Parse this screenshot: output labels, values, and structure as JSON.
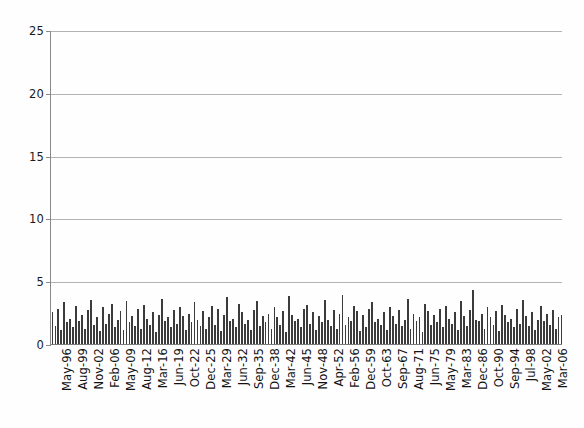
{
  "chart_data": {
    "type": "bar",
    "title": "",
    "subtitle": "",
    "xlabel": "",
    "ylabel": "",
    "ylim": [
      0,
      25
    ],
    "yticks": [
      0,
      5,
      10,
      15,
      20,
      25
    ],
    "grid": true,
    "legend": false,
    "legend_position": "none",
    "series_color": "#3b3b3b",
    "gridline_color": "#b3b3b3",
    "axis_color": "#8a8a8a",
    "bar_count": 173,
    "x_tick_labels": [
      "May-96",
      "Aug-99",
      "Nov-02",
      "Feb-06",
      "May-09",
      "Aug-12",
      "Mar-16",
      "Jun-19",
      "Oct-22",
      "Dec-25",
      "Mar-29",
      "Jun-32",
      "Sep-35",
      "Dec-38",
      "Mar-42",
      "Jun-45",
      "Nov-48",
      "Apr-52",
      "Feb-56",
      "Dec-59",
      "Oct-63",
      "Sep-67",
      "Aug-71",
      "Jun-75",
      "May-79",
      "Mar-83",
      "Dec-86",
      "Oct-90",
      "Sep-94",
      "Jul-98",
      "May-02",
      "Mar-06"
    ],
    "values": [
      2.6,
      1.5,
      2.9,
      1.2,
      3.4,
      1.8,
      2.1,
      1.4,
      3.1,
      1.9,
      2.4,
      1.3,
      2.8,
      3.6,
      1.6,
      2.2,
      1.1,
      3.0,
      1.7,
      2.5,
      3.3,
      1.4,
      2.0,
      2.7,
      1.2,
      3.5,
      1.8,
      2.3,
      1.5,
      2.9,
      1.3,
      3.2,
      2.1,
      1.6,
      2.6,
      1.0,
      2.4,
      3.7,
      1.9,
      2.2,
      1.4,
      2.8,
      1.7,
      3.0,
      2.3,
      1.2,
      2.5,
      1.8,
      3.4,
      2.0,
      1.5,
      2.7,
      1.3,
      2.2,
      3.1,
      1.6,
      2.9,
      1.1,
      2.4,
      3.8,
      1.9,
      2.1,
      1.4,
      3.3,
      2.6,
      1.7,
      2.0,
      1.2,
      2.8,
      3.5,
      1.5,
      2.3,
      1.8,
      2.5,
      1.3,
      3.0,
      2.2,
      1.6,
      2.7,
      1.0,
      3.9,
      2.4,
      1.9,
      2.1,
      1.4,
      2.9,
      3.2,
      1.7,
      2.6,
      1.2,
      2.3,
      1.8,
      3.6,
      2.0,
      1.5,
      2.8,
      1.3,
      2.5,
      4.0,
      1.6,
      2.2,
      1.9,
      3.1,
      2.7,
      1.1,
      2.4,
      1.4,
      2.9,
      3.4,
      1.8,
      2.1,
      1.6,
      2.6,
      1.2,
      3.0,
      2.3,
      1.7,
      2.8,
      1.5,
      2.0,
      3.7,
      1.3,
      2.5,
      1.9,
      2.2,
      1.0,
      3.3,
      2.7,
      1.6,
      2.4,
      1.8,
      2.9,
      1.4,
      3.1,
      2.1,
      1.7,
      2.6,
      1.2,
      3.5,
      2.3,
      1.5,
      2.8,
      4.4,
      2.0,
      1.9,
      2.5,
      1.3,
      3.0,
      2.2,
      1.6,
      2.7,
      1.1,
      3.2,
      2.4,
      1.8,
      2.1,
      1.4,
      2.9,
      1.7,
      3.6,
      2.3,
      1.5,
      2.6,
      1.2,
      2.0,
      3.1,
      1.9,
      2.5,
      1.6,
      2.8,
      1.3,
      2.2,
      2.4
    ]
  },
  "axis": {
    "y_labels": [
      "25",
      "20",
      "15",
      "10",
      "5",
      "0"
    ]
  }
}
